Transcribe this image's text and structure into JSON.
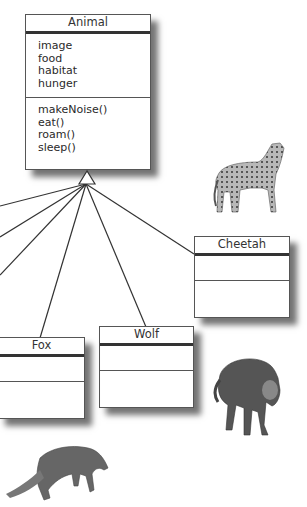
{
  "diagram": {
    "superclass": {
      "name": "Animal",
      "attributes": [
        "image",
        "food",
        "habitat",
        "hunger"
      ],
      "methods": [
        "makeNoise()",
        "eat()",
        "roam()",
        "sleep()"
      ]
    },
    "subclasses": [
      {
        "name": "Cheetah",
        "attributes": [],
        "methods": []
      },
      {
        "name": "Wolf",
        "attributes": [],
        "methods": []
      },
      {
        "name": "Fox",
        "attributes": [],
        "methods": []
      }
    ],
    "relationship": "inheritance",
    "images": [
      "cheetah-photo",
      "wolf-photo",
      "fox-photo"
    ]
  }
}
